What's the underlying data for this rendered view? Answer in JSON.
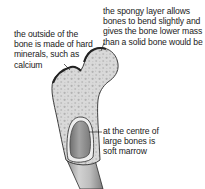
{
  "diagram": {
    "labels": {
      "outside": {
        "lines": [
          "the outside of the",
          "bone is made of hard",
          "minerals, such as",
          "calcium"
        ]
      },
      "spongy": {
        "lines": [
          "the spongy layer allows",
          "bones to bend slightly and",
          "gives the bone lower mass",
          "than a solid bone would be"
        ]
      },
      "marrow": {
        "lines": [
          "at the centre of",
          "large bones is",
          "soft marrow"
        ]
      }
    },
    "colors": {
      "outline": "#2b2b2b",
      "spongy_fill": "#d6d6d6",
      "spongy_dots": "#b4b4b4",
      "shaft_fill": "#c4c4c4",
      "marrow_fill": "#8f8f8f",
      "text": "#1a1a1a"
    }
  }
}
